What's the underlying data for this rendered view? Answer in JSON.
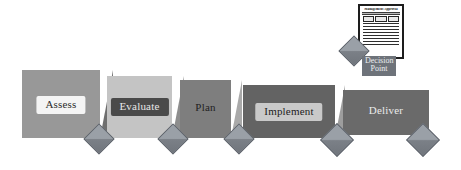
{
  "diagram": {
    "type": "process-flow"
  },
  "stages": [
    {
      "id": "assess",
      "label": "Assess",
      "face_color": "#989898",
      "side_color": "#6f6f6f",
      "label_bg": "#f4f4f4",
      "label_color": "#2b2b2b",
      "label_style": "plate"
    },
    {
      "id": "evaluate",
      "label": "Evaluate",
      "face_color": "#c4c4c4",
      "side_color": "#8d8d8d",
      "label_bg": "#4a4a4a",
      "label_color": "#e8e8e8",
      "label_style": "plate"
    },
    {
      "id": "plan",
      "label": "Plan",
      "face_color": "#7e7e7e",
      "side_color": "#a9a9a9",
      "label_bg": "transparent",
      "label_color": "#1f1f1f",
      "label_style": "bare"
    },
    {
      "id": "implement",
      "label": "Implement",
      "face_color": "#636363",
      "side_color": "#9d9d9d",
      "label_bg": "#c9c9c9",
      "label_color": "#1c1c1c",
      "label_style": "plate"
    },
    {
      "id": "deliver",
      "label": "Deliver",
      "face_color": "#6a6a6a",
      "side_color": "#6a6a6a",
      "label_bg": "transparent",
      "label_color": "#eaeaea",
      "label_style": "bare"
    }
  ],
  "milestones": [
    {
      "id": "milestone-1",
      "after_stage": "assess"
    },
    {
      "id": "milestone-2",
      "after_stage": "evaluate"
    },
    {
      "id": "milestone-3",
      "after_stage": "plan"
    },
    {
      "id": "milestone-4",
      "after_stage": "implement"
    },
    {
      "id": "milestone-5",
      "after_stage": "deliver"
    }
  ],
  "decision_point": {
    "document_title": "Management Approval",
    "caption_line1": "Decision",
    "caption_line2": "Point",
    "caption_bg": "#6e737a",
    "caption_color": "#eceff2",
    "marker_id": "decision-diamond"
  },
  "colors": {
    "background": "#ffffff",
    "diamond_fill": "#8a8f96",
    "diamond_stroke": "#5d626a",
    "document_border": "#1d1d1d",
    "document_fill": "#ffffff"
  }
}
